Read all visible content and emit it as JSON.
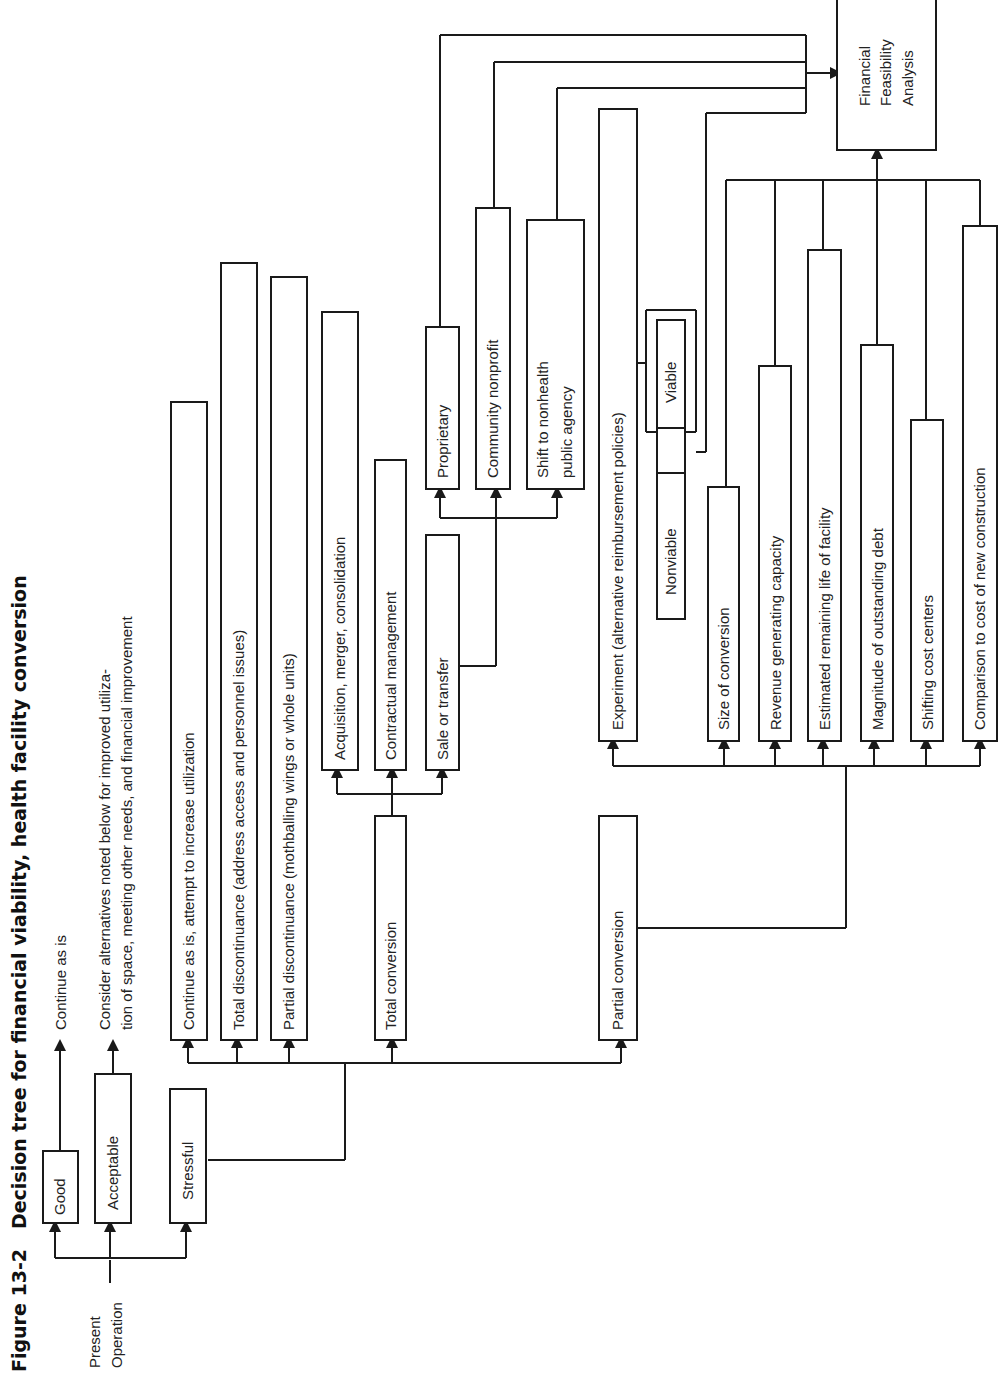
{
  "figure": {
    "number": "Figure 13-2",
    "title": "Decision tree for financial viability, health facility conversion"
  },
  "root": {
    "label_line1": "Present",
    "label_line2": "Operation"
  },
  "level1": {
    "good": "Good",
    "acceptable": "Acceptable",
    "stressful": "Stressful"
  },
  "outcomes": {
    "good_outcome": "Continue as is",
    "acceptable_outcome_line1": "Consider alternatives noted below for improved utiliza-",
    "acceptable_outcome_line2": "tion of space, meeting other needs, and financial improvement"
  },
  "stressful_options": {
    "continue": "Continue as is, attempt to increase utilization",
    "total_discontinuance": "Total discontinuance (address access and personnel issues)",
    "partial_discontinuance": "Partial discontinuance (mothballing wings or whole units)",
    "total_conversion": "Total conversion",
    "partial_conversion": "Partial conversion"
  },
  "total_conversion_options": {
    "acquisition": "Acquisition, merger, consolidation",
    "contractual": "Contractual management",
    "sale": "Sale or transfer"
  },
  "sale_options": {
    "proprietary": "Proprietary",
    "community": "Community nonprofit",
    "shift_line1": "Shift to nonhealth",
    "shift_line2": "public agency"
  },
  "partial_conversion_options": {
    "experiment": "Experiment (alternative reimbursement policies)",
    "nonviable": "Nonviable",
    "viable": "Viable",
    "size": "Size of conversion",
    "revenue": "Revenue generating capacity",
    "remaining_life": "Estimated remaining life of facility",
    "debt": "Magnitude of outstanding debt",
    "cost_centers": "Shifting cost centers",
    "comparison": "Comparison to cost of new construction"
  },
  "final": {
    "line1": "Financial",
    "line2": "Feasibility",
    "line3": "Analysis"
  }
}
